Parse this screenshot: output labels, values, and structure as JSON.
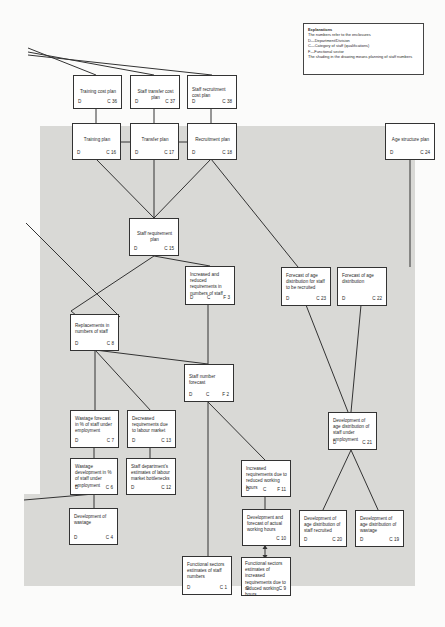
{
  "legend": {
    "title": "Explanations",
    "lines": [
      "The numbers refer to the enclosures",
      "D—Department/Division",
      "C—Category of staff (qualifications)",
      "F—Functional sector",
      "The shading in the drawing means planning of staff numbers"
    ]
  },
  "boxes": {
    "training_cost_plan": {
      "title": "Training cost plan",
      "d": "D",
      "c": "C 36"
    },
    "staff_transfer_cost_plan": {
      "title": "Staff transfer cost plan",
      "d": "D",
      "c": "C 37"
    },
    "staff_recruitment_cost_plan": {
      "title": "Staff recruitment cost plan",
      "d": "D",
      "c": "C 38"
    },
    "training_plan": {
      "title": "Training plan",
      "d": "D",
      "c": "C 16"
    },
    "transfer_plan": {
      "title": "Transfer plan",
      "d": "D",
      "c": "C 17"
    },
    "recruitment_plan": {
      "title": "Recruitment plan",
      "d": "D",
      "c": "C 18"
    },
    "age_structure_plan": {
      "title": "Age structure plan",
      "d": "D",
      "c": "C 24"
    },
    "staff_requirement_plan": {
      "title": "Staff requirement plan",
      "d": "D",
      "c": "C 15"
    },
    "increased_reduced_requirements": {
      "title": "Increased and reduced requirements in numbers of staff",
      "d": "D",
      "c": "C",
      "f": "F 3"
    },
    "forecast_age_recruited": {
      "title": "Forecast of age distribution for staff to be recruited",
      "d": "D",
      "c": "C 23"
    },
    "forecast_age_distribution": {
      "title": "Forecast of age distribution",
      "d": "D",
      "c": "C 22"
    },
    "replacements": {
      "title": "Replacements in numbers of staff",
      "d": "D",
      "c": "C 8"
    },
    "staff_number_forecast": {
      "title": "Staff number forecast",
      "d": "D",
      "c": "C",
      "f": "F 2"
    },
    "wastage_forecast": {
      "title": "Wastage forecast in % of staff under employment",
      "d": "D",
      "c": "C 7"
    },
    "decreased_requirements": {
      "title": "Decreased requirements due to labour market",
      "d": "D",
      "c": "C 13"
    },
    "development_age_under_employment": {
      "title": "Development of age distribution of staff under employment",
      "d": "D",
      "c": "C 21"
    },
    "wastage_development": {
      "title": "Wastage development in % of staff under employment",
      "d": "D",
      "c": "C 6"
    },
    "staff_dept_estimates": {
      "title": "Staff department's estimates of labour market bottlenecks",
      "d": "D",
      "c": "C 12"
    },
    "increased_requirements_hours": {
      "title": "Increased requirements due to reduced working hours",
      "d": "D",
      "c": "C",
      "f": "F 11"
    },
    "development_of_wastage": {
      "title": "Development of wastage",
      "d": "D",
      "c": "C 4"
    },
    "development_forecast_hours": {
      "title": "Development and forecast of actual working hours",
      "d": "",
      "c": "C 10"
    },
    "development_age_recruited": {
      "title": "Development of age distribution of staff recruited",
      "d": "D",
      "c": "C 20"
    },
    "development_age_wastage": {
      "title": "Development of age distribution of wastage",
      "d": "D",
      "c": "C 19"
    },
    "functional_sectors_staff": {
      "title": "Functional sectors estimates of staff numbers",
      "d": "D",
      "c": "C 1"
    },
    "functional_sectors_increased": {
      "title": "Functional sectors estimates of increased requirements due to reduced working hours",
      "d": "D",
      "c": "C 9"
    }
  },
  "colors": {
    "shading": "#d9d9d6",
    "box_fill": "#ffffff",
    "line": "#333333",
    "page": "#fbfbfa"
  }
}
